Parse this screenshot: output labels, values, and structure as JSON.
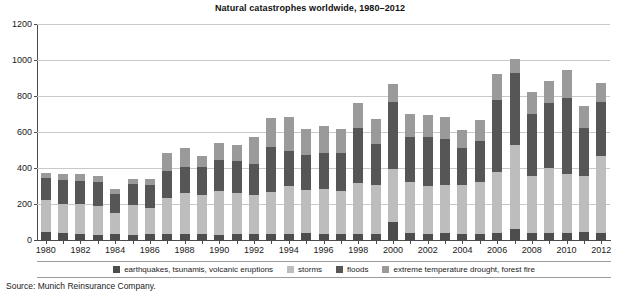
{
  "chart_data": {
    "type": "bar",
    "title": "Natural catastrophes worldwide, 1980–2012",
    "xlabel": "",
    "ylabel": "",
    "ylim": [
      0,
      1200
    ],
    "yticks": [
      0,
      200,
      400,
      600,
      800,
      1000,
      1200
    ],
    "grid": true,
    "stacked": true,
    "legend_position": "bottom",
    "source": "Source: Munich Reinsurance Company.",
    "categories": [
      "1980",
      "1981",
      "1982",
      "1983",
      "1984",
      "1985",
      "1986",
      "1987",
      "1988",
      "1989",
      "1990",
      "1991",
      "1992",
      "1993",
      "1994",
      "1995",
      "1996",
      "1997",
      "1998",
      "1999",
      "2000",
      "2001",
      "2002",
      "2003",
      "2004",
      "2005",
      "2006",
      "2007",
      "2008",
      "2009",
      "2010",
      "2011",
      "2012"
    ],
    "xtick_labels": [
      "1980",
      "1982",
      "1984",
      "1986",
      "1988",
      "1990",
      "1992",
      "1994",
      "1996",
      "1998",
      "2000",
      "2002",
      "2004",
      "2006",
      "2008",
      "2010",
      "2012"
    ],
    "series": [
      {
        "name": "earthquakes, tsunamis, volcanic eruptions",
        "color": "#4d4d4d",
        "values": [
          45,
          40,
          35,
          30,
          35,
          30,
          35,
          35,
          35,
          35,
          30,
          35,
          35,
          35,
          35,
          40,
          35,
          35,
          35,
          35,
          100,
          40,
          35,
          40,
          35,
          35,
          40,
          60,
          40,
          40,
          40,
          45,
          40
        ]
      },
      {
        "name": "storms",
        "color": "#bdbdbd",
        "values": [
          175,
          160,
          165,
          160,
          115,
          165,
          145,
          200,
          225,
          215,
          240,
          225,
          215,
          230,
          265,
          240,
          250,
          235,
          280,
          270,
          295,
          280,
          265,
          265,
          270,
          290,
          340,
          470,
          315,
          360,
          325,
          310,
          425
        ]
      },
      {
        "name": "floods",
        "color": "#565656",
        "values": [
          125,
          135,
          130,
          130,
          105,
          115,
          125,
          150,
          145,
          155,
          175,
          180,
          175,
          250,
          195,
          195,
          200,
          215,
          310,
          230,
          370,
          255,
          270,
          255,
          205,
          225,
          400,
          400,
          345,
          360,
          425,
          270,
          300
        ]
      },
      {
        "name": "extreme temperature drought, forest fire",
        "color": "#9a9a9a",
        "values": [
          30,
          30,
          35,
          35,
          30,
          30,
          35,
          100,
          105,
          60,
          95,
          90,
          145,
          165,
          190,
          140,
          150,
          130,
          135,
          140,
          100,
          125,
          125,
          125,
          100,
          115,
          145,
          75,
          125,
          125,
          155,
          120,
          110
        ]
      }
    ]
  }
}
